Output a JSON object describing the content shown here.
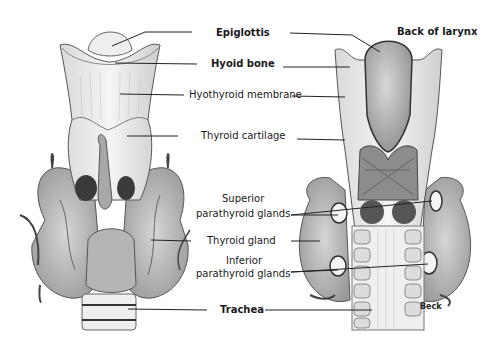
{
  "figure": {
    "views": [
      "Front view",
      "Back view"
    ],
    "labels": {
      "epiglottis": "Epiglottis",
      "back_of_larynx": "Back of larynx",
      "hyoid_bone": "Hyoid bone",
      "hyothyroid_membrane": "Hyothyroid membrane",
      "thyroid_cartilage": "Thyroid cartilage",
      "superior_parathyroid_1": "Superior",
      "superior_parathyroid_2": "parathyroid glands",
      "thyroid_gland": "Thyroid gland",
      "inferior_parathyroid_1": "Inferior",
      "inferior_parathyroid_2": "parathyroid glands",
      "trachea": "Trachea"
    },
    "signature": "Beck",
    "colors": {
      "line": "#222222",
      "tissue_light": "#e6e6e6",
      "tissue_mid": "#bdbdbd",
      "tissue_dark": "#6e6e6e",
      "background": "#ffffff"
    }
  }
}
